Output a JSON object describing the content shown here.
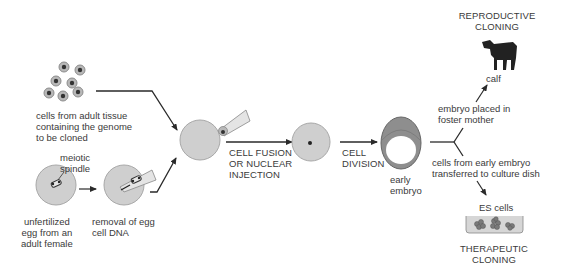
{
  "colors": {
    "cell_fill": "#cfcfcf",
    "cell_stroke": "#a8a8a8",
    "arrow": "#2a2a2a",
    "calf": "#222222",
    "dish_fill": "#d6d6d6"
  },
  "labels": {
    "adult_cells": [
      "cells from adult tissue",
      "containing the genome",
      "to be cloned"
    ],
    "meiotic_spindle": [
      "meiotic",
      "spindle"
    ],
    "unfertilized_egg": [
      "unfertilized",
      "egg from an",
      "adult female"
    ],
    "removal": [
      "removal of egg",
      "cell DNA"
    ],
    "fusion": [
      "CELL FUSION",
      "OR NUCLEAR",
      "INJECTION"
    ],
    "division": [
      "CELL",
      "DIVISION"
    ],
    "early_embryo": [
      "early",
      "embryo"
    ],
    "reproductive_title": [
      "REPRODUCTIVE",
      "CLONING"
    ],
    "calf": "calf",
    "foster": [
      "embryo placed in",
      "foster mother"
    ],
    "transfer": [
      "cells from early embryo",
      "transferred to culture dish"
    ],
    "es_cells": "ES cells",
    "therapeutic_title": [
      "THERAPEUTIC",
      "CLONING"
    ]
  },
  "icons": {
    "adult_cells": "cell-cluster-icon",
    "egg": "egg-cell-icon",
    "pipette": "micropipette-icon",
    "embryo": "blastocyst-icon",
    "calf": "calf-icon",
    "dish": "culture-dish-icon"
  }
}
